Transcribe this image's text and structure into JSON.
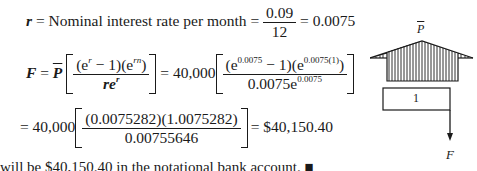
{
  "line1": {
    "var": "r",
    "eq": " = ",
    "label": "Nominal interest rate per month",
    "eq2": " = ",
    "numerator": "0.09",
    "denominator": "12",
    "result": " = 0.0075"
  },
  "line2": {
    "lhs": "F",
    "eq": " = ",
    "pbar": "P",
    "frac_num_a": "(e",
    "frac_num_a_sup": "r",
    "frac_num_b": " − 1)(e",
    "frac_num_b_sup": "rn",
    "frac_num_c": ")",
    "frac_den": "re",
    "frac_den_sup": "r",
    "eq2": " = 40,000",
    "frac2_num_a": "(e",
    "frac2_num_a_sup": "0.0075",
    "frac2_num_b": " − 1)(e",
    "frac2_num_b_sup": "0.0075(1)",
    "frac2_num_c": ")",
    "frac2_den": "0.0075e",
    "frac2_den_sup": "0.0075"
  },
  "line3": {
    "prefix": "= 40,000",
    "num": "(0.0075282)(1.0075282)",
    "den": "0.00755646",
    "result": "= $40,150.40"
  },
  "diagram": {
    "top_label": "P",
    "box_label": "1",
    "arrow_label": "F"
  },
  "footer_clipped": "will be $40,150.40 in the notational bank account. ■"
}
